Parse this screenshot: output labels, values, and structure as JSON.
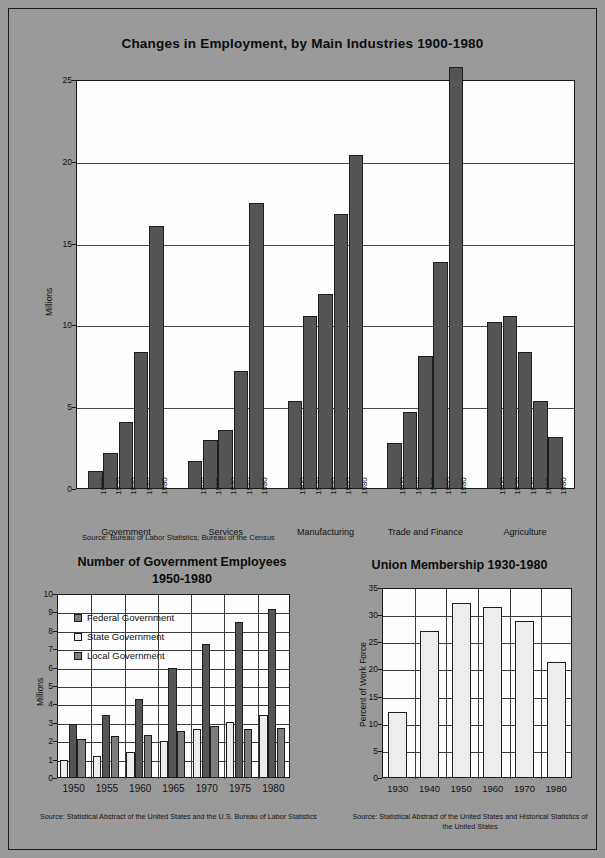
{
  "main": {
    "title": "Changes in Employment, by Main Industries   1900-1980",
    "ylabel": "Millions",
    "source": "Source: Bureau of Labor Statistics; Bureau of the Census"
  },
  "bottom_left": {
    "title_line1": "Number of Government Employees",
    "title_line2": "1950-1980",
    "ylabel": "Millions",
    "source": "Source: Statistical Abstract of the United States and the U.S. Bureau of Labor Statistics",
    "legend": [
      {
        "label": "Federal Government",
        "color": "#7d7d7d"
      },
      {
        "label": "State Government",
        "color": "#ededed"
      },
      {
        "label": "Local Government",
        "color": "#7d7d7d"
      }
    ]
  },
  "bottom_right": {
    "title": "Union Membership   1930-1980",
    "ylabel": "Percent of Work Force",
    "source": "Source: Statistical Abstract of the United States and Historical Statistics of the United States"
  },
  "chart_data": [
    {
      "id": "employment-by-industry",
      "type": "bar",
      "title": "Changes in Employment, by Main Industries   1900-1980",
      "xlabel": "",
      "ylabel": "Millions",
      "ylim": [
        0,
        25
      ],
      "yticks": [
        0,
        5,
        10,
        15,
        20,
        25
      ],
      "grid": true,
      "legend": "none",
      "groups": [
        "Government",
        "Services",
        "Manufacturing",
        "Trade and Finance",
        "Agriculture"
      ],
      "categories": [
        "1900",
        "1920",
        "1940",
        "1960",
        "1980"
      ],
      "series": [
        {
          "name": "Government",
          "values": [
            1.1,
            2.2,
            4.1,
            8.4,
            16.1
          ]
        },
        {
          "name": "Services",
          "values": [
            1.7,
            3.0,
            3.6,
            7.2,
            17.5
          ]
        },
        {
          "name": "Manufacturing",
          "values": [
            5.4,
            10.6,
            11.9,
            16.8,
            20.4
          ]
        },
        {
          "name": "Trade and Finance",
          "values": [
            2.8,
            4.7,
            8.1,
            13.9,
            25.8
          ]
        },
        {
          "name": "Agriculture",
          "values": [
            10.2,
            10.6,
            8.4,
            5.4,
            3.2
          ]
        }
      ],
      "source": "Source: Bureau of Labor Statistics; Bureau of the Census"
    },
    {
      "id": "government-employees",
      "type": "bar",
      "title": "Number of Government Employees 1950-1980",
      "xlabel": "",
      "ylabel": "Millions",
      "ylim": [
        0,
        10
      ],
      "yticks": [
        0,
        1,
        2,
        3,
        4,
        5,
        6,
        7,
        8,
        9,
        10
      ],
      "grid": true,
      "legend": "inside-top-left",
      "categories": [
        "1950",
        "1955",
        "1960",
        "1965",
        "1970",
        "1975",
        "1980"
      ],
      "series": [
        {
          "name": "Federal Government",
          "values": [
            2.1,
            2.3,
            2.35,
            2.55,
            2.85,
            2.65,
            2.7
          ]
        },
        {
          "name": "State Government",
          "values": [
            1.0,
            1.2,
            1.4,
            2.0,
            2.65,
            3.05,
            3.45
          ]
        },
        {
          "name": "Local Government",
          "values": [
            2.95,
            3.4,
            4.3,
            6.0,
            7.3,
            8.5,
            9.2
          ]
        }
      ],
      "source": "Source: Statistical Abstract of the United States and the U.S. Bureau of Labor Statistics"
    },
    {
      "id": "union-membership",
      "type": "bar",
      "title": "Union Membership   1930-1980",
      "xlabel": "",
      "ylabel": "Percent of Work Force",
      "ylim": [
        0,
        35
      ],
      "yticks": [
        0,
        5,
        10,
        15,
        20,
        25,
        30,
        35
      ],
      "grid": true,
      "legend": "none",
      "categories": [
        "1930",
        "1940",
        "1950",
        "1960",
        "1970",
        "1980"
      ],
      "values": [
        12.2,
        27.1,
        32.3,
        31.5,
        29.0,
        21.4
      ],
      "source": "Source: Statistical Abstract of the United States and Historical Statistics of the United States"
    }
  ]
}
